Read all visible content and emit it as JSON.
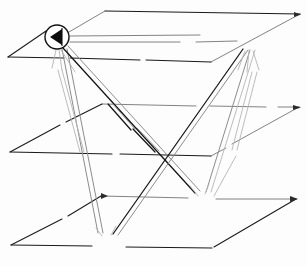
{
  "figure": {
    "title": "Three-layer network overlay diagram",
    "description": "Hand-drawn style diagram of three stacked parallelogram planes connected by lines between four circular node markers.",
    "style": "scanned line art, black ink on white",
    "width": 307,
    "height": 266,
    "ink_color": "#131313",
    "pale_ink_color": "#8c8c8c",
    "background_color": "#fdfdfd"
  },
  "planes": [
    {
      "id": "plane-top",
      "label": "Top plane",
      "order": 1,
      "points": "105,11 300,14 210,62 8,58"
    },
    {
      "id": "plane-middle",
      "label": "Middle plane",
      "order": 2,
      "points": "102,104 300,107 211,156 10,152"
    },
    {
      "id": "plane-bottom",
      "label": "Bottom plane",
      "order": 3,
      "points": "101,196 297,199 212,249 11,245"
    }
  ],
  "nodes": [
    {
      "id": "node-top-left",
      "label": "Node A",
      "glyph": "left-triangle",
      "plane": "plane-top",
      "cx": 57,
      "cy": 37,
      "r": 12
    },
    {
      "id": "node-top-right",
      "label": "Node B",
      "glyph": "right-triangle",
      "plane": "plane-top",
      "cx": 250,
      "cy": 38,
      "r": 12
    },
    {
      "id": "node-bottom-right",
      "label": "Node C",
      "glyph": "flag-bar",
      "plane": "plane-bottom",
      "cx": 202,
      "cy": 204,
      "r": 12
    },
    {
      "id": "node-bottom-center",
      "label": "Node D",
      "glyph": "flag-p",
      "plane": "plane-bottom",
      "cx": 106,
      "cy": 246,
      "r": 13
    }
  ],
  "links": [
    {
      "id": "link-a-d-1",
      "from": "node-top-left",
      "to": "node-bottom-center",
      "tone": "pale",
      "path": "M 62,49 L 98,234"
    },
    {
      "id": "link-a-d-2",
      "from": "node-top-left",
      "to": "node-bottom-center",
      "tone": "pale",
      "path": "M 66,49 L 103,234"
    },
    {
      "id": "link-a-c-1",
      "from": "node-top-left",
      "to": "node-bottom-right",
      "tone": "solid",
      "path": "M 64,48 L 196,193"
    },
    {
      "id": "link-a-c-2",
      "from": "node-top-left",
      "to": "node-bottom-right",
      "tone": "pale",
      "path": "M 68,47 L 200,192"
    },
    {
      "id": "link-b-d-1",
      "from": "node-top-right",
      "to": "node-bottom-center",
      "tone": "solid",
      "path": "M 243,49 L 113,235"
    },
    {
      "id": "link-b-d-2",
      "from": "node-top-right",
      "to": "node-bottom-center",
      "tone": "pale",
      "path": "M 247,50 L 117,236"
    },
    {
      "id": "link-b-c-1",
      "from": "node-top-right",
      "to": "node-bottom-right",
      "tone": "pale",
      "path": "M 249,50 L 205,192"
    },
    {
      "id": "link-b-c-2",
      "from": "node-top-right",
      "to": "node-bottom-right",
      "tone": "ghost",
      "path": "M 254,50 L 210,192"
    },
    {
      "id": "link-mid-a",
      "from": "node-top-left",
      "to": "plane-middle",
      "tone": "ghost",
      "path": "M 59,49 L 86,150"
    },
    {
      "id": "link-mid-b",
      "from": "node-top-right",
      "to": "plane-middle",
      "tone": "ghost",
      "path": "M 252,50 L 228,150"
    },
    {
      "id": "link-stub-1",
      "from": "plane-middle",
      "to": "plane-middle",
      "tone": "solid",
      "path": "M 131,116 L 158,152"
    },
    {
      "id": "link-stub-2",
      "from": "plane-middle",
      "to": "plane-middle",
      "tone": "pale",
      "path": "M 135,115 L 162,151"
    }
  ],
  "plane_arrows": [
    {
      "id": "arrow-top-right",
      "label": "top plane right tip",
      "x": 299,
      "y": 14
    },
    {
      "id": "arrow-middle-right",
      "label": "middle plane right tip",
      "x": 299,
      "y": 107
    },
    {
      "id": "arrow-bottom-right",
      "label": "bottom plane right tip",
      "x": 296,
      "y": 199
    }
  ]
}
